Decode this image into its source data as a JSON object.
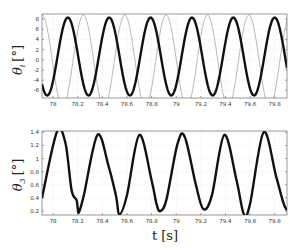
{
  "chart_data": [
    {
      "type": "line",
      "title": "",
      "xlabel": "t [s]",
      "ylabel": "θ_i [°]",
      "xlim": [
        77.91,
        79.9
      ],
      "ylim": [
        -7.5,
        9
      ],
      "xticks": [
        "78",
        "78.2",
        "78.4",
        "78.6",
        "78.8",
        "79",
        "79.2",
        "79.4",
        "79.6",
        "79.8"
      ],
      "yticks": [
        "8",
        "6",
        "4",
        "2",
        "0",
        "-2",
        "-4",
        "-6"
      ],
      "grid": true,
      "legend": null,
      "series": [
        {
          "name": "thick",
          "style": "thick-black",
          "model": "sine",
          "amplitude_high": 8.3,
          "amplitude_low": -7.0,
          "period_s": 0.336,
          "first_peak_t": 78.12
        },
        {
          "name": "thin",
          "style": "thin-gray",
          "model": "sine",
          "amplitude": 9.0,
          "offset": -0.2,
          "period_s": 0.336,
          "first_peak_t": 77.91
        }
      ]
    },
    {
      "type": "line",
      "title": "",
      "xlabel": "t [s]",
      "ylabel": "θ_3 [°]",
      "xlim": [
        77.91,
        79.9
      ],
      "ylim": [
        0.14,
        1.42
      ],
      "xticks": [
        "78",
        "78.2",
        "78.4",
        "78.6",
        "78.8",
        "79",
        "79.2",
        "79.4",
        "79.6",
        "79.8"
      ],
      "yticks": [
        "1.4",
        "1.2",
        "1",
        "0.8",
        "0.6",
        "0.4",
        "0.2"
      ],
      "grid": true,
      "legend": null,
      "series": [
        {
          "name": "theta3",
          "style": "thick-black",
          "x": [
            77.91,
            78.03,
            78.1,
            78.15,
            78.19,
            78.2,
            78.21,
            78.25,
            78.36,
            78.45,
            78.51,
            78.54,
            78.6,
            78.7,
            78.8,
            78.84,
            78.87,
            78.92,
            79.01,
            79.07,
            79.16,
            79.22,
            79.29,
            79.39,
            79.49,
            79.55,
            79.6,
            79.71,
            79.81,
            79.87,
            79.9
          ],
          "values": [
            0.4,
            1.4,
            1.24,
            0.52,
            0.37,
            0.25,
            0.18,
            0.44,
            1.36,
            0.89,
            0.44,
            0.15,
            0.44,
            1.36,
            0.67,
            0.31,
            0.2,
            0.37,
            1.22,
            1.33,
            0.6,
            0.23,
            0.44,
            1.36,
            0.67,
            0.15,
            0.31,
            1.4,
            0.74,
            0.33,
            0.21
          ]
        }
      ]
    }
  ],
  "labels": {
    "top_ylabel_main": "θ",
    "top_ylabel_sub": "i",
    "top_ylabel_unit": "[°]",
    "bottom_ylabel_main": "θ",
    "bottom_ylabel_sub": "3",
    "bottom_ylabel_unit": "[°]",
    "xlabel": "t [s]"
  }
}
